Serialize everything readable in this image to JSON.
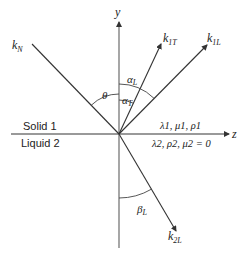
{
  "diagram": {
    "axes": {
      "y_label": "y",
      "z_label": "z"
    },
    "media": {
      "upper": "Solid 1",
      "lower": "Liquid 2",
      "upper_params": "λ1, μ1, ρ1",
      "lower_params": "λ2, ρ2, μ2 = 0"
    },
    "vectors": {
      "incident": {
        "base": "k",
        "sub": "N"
      },
      "reflected_transverse": {
        "base": "k",
        "sub": "1T"
      },
      "reflected_longitudinal": {
        "base": "k",
        "sub": "1L"
      },
      "transmitted_longitudinal": {
        "base": "k",
        "sub": "2L"
      }
    },
    "angles": {
      "incidence": "θ",
      "alpha_L": {
        "base": "α",
        "sub": "L"
      },
      "alpha_T": {
        "base": "α",
        "sub": "T"
      },
      "beta_L": {
        "base": "β",
        "sub": "L"
      }
    },
    "colors": {
      "line": "#333333",
      "axis": "#666666",
      "text": "#222222"
    }
  }
}
